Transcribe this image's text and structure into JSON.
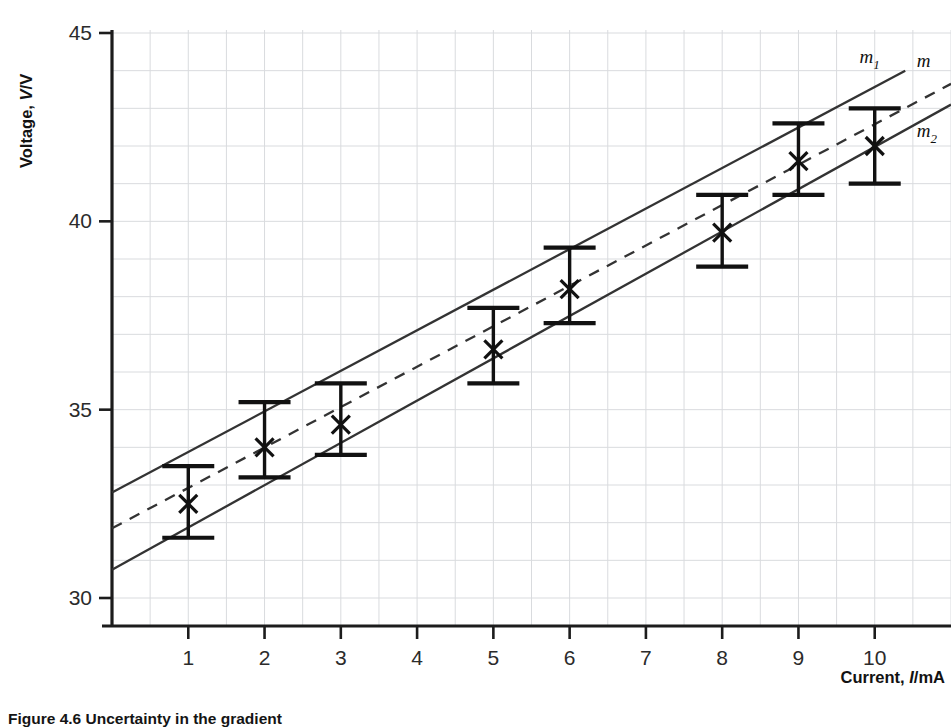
{
  "figure": {
    "caption": "Figure 4.6 Uncertainty in the gradient"
  },
  "chart_data": {
    "type": "scatter",
    "title": "",
    "xlabel_text": "Current, ",
    "xlabel_symbol": "I",
    "xlabel_unit": "/mA",
    "ylabel_text": "Voltage, ",
    "ylabel_symbol": "V",
    "ylabel_unit": "/V",
    "xlim": [
      0,
      11
    ],
    "ylim": [
      29.5,
      45
    ],
    "xticks": [
      1,
      2,
      3,
      4,
      5,
      6,
      7,
      8,
      9,
      10
    ],
    "yticks": [
      30,
      35,
      40,
      45
    ],
    "grid": true,
    "grid_minor_step_x": 0.5,
    "grid_step_y": 1,
    "marker": "cross",
    "x": [
      1,
      2,
      3,
      5,
      6,
      8,
      9,
      10
    ],
    "y": [
      32.5,
      34.0,
      34.6,
      36.6,
      38.2,
      39.7,
      41.6,
      42.0
    ],
    "yerr_upper": [
      33.5,
      35.2,
      35.7,
      37.7,
      39.3,
      40.7,
      42.6,
      43.0
    ],
    "yerr_lower": [
      31.6,
      33.2,
      33.8,
      35.7,
      37.3,
      38.8,
      40.7,
      41.0
    ],
    "yerr": [
      1.0,
      1.0,
      1.0,
      1.0,
      1.0,
      1.0,
      1.0,
      1.0
    ],
    "fit_lines": [
      {
        "name": "m",
        "label": "m",
        "subscript": "",
        "style": "dashed",
        "x_start": 0.0,
        "y_start": 31.85,
        "x_end": 11.0,
        "y_end": 43.65,
        "label_x": 10.55,
        "label_y": 44.1
      },
      {
        "name": "m1",
        "label": "m",
        "subscript": "1",
        "style": "solid",
        "x_start": 0.0,
        "y_start": 32.8,
        "x_end": 10.4,
        "y_end": 44.0,
        "label_x": 9.8,
        "label_y": 44.2
      },
      {
        "name": "m2",
        "label": "m",
        "subscript": "2",
        "style": "solid",
        "x_start": 0.0,
        "y_start": 30.75,
        "x_end": 11.0,
        "y_end": 43.1,
        "label_x": 10.55,
        "label_y": 42.25
      }
    ]
  }
}
